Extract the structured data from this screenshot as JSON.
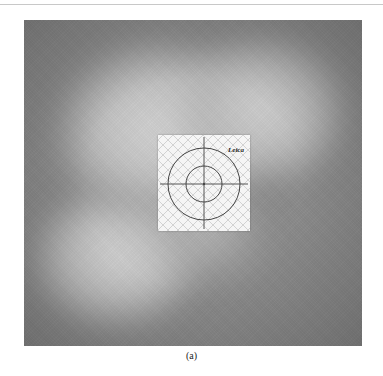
{
  "figure": {
    "caption": "(a)",
    "target": {
      "type": "reflective survey target",
      "logo_text": "Leica"
    }
  }
}
